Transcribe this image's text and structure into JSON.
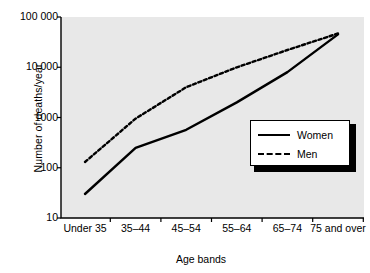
{
  "chart_data": {
    "type": "line",
    "title": "",
    "subtitle": "",
    "xlabel": "Age bands",
    "ylabel": "Number of deaths/year",
    "categories": [
      "Under 35",
      "35–44",
      "45–54",
      "55–64",
      "65–74",
      "75 and over"
    ],
    "yscale": "log",
    "ylim": [
      10,
      100000
    ],
    "yticks": [
      10,
      100,
      1000,
      10000,
      100000
    ],
    "ytick_labels": [
      "10",
      "100",
      "1000",
      "10 000",
      "100 000"
    ],
    "grid": false,
    "legend_position": "center-right",
    "plot_background": "#e8e8e8",
    "series": [
      {
        "name": "Women",
        "style": "solid",
        "color": "#000000",
        "values": [
          30,
          250,
          570,
          2000,
          8000,
          45000
        ]
      },
      {
        "name": "Men",
        "style": "dashed",
        "color": "#000000",
        "values": [
          130,
          950,
          4000,
          10000,
          22000,
          47000
        ]
      }
    ]
  },
  "legend": {
    "items": [
      {
        "label": "Women",
        "style": "solid"
      },
      {
        "label": "Men",
        "style": "dashed"
      }
    ]
  },
  "axes": {
    "x_title": "Age bands",
    "y_title": "Number of deaths/year"
  }
}
